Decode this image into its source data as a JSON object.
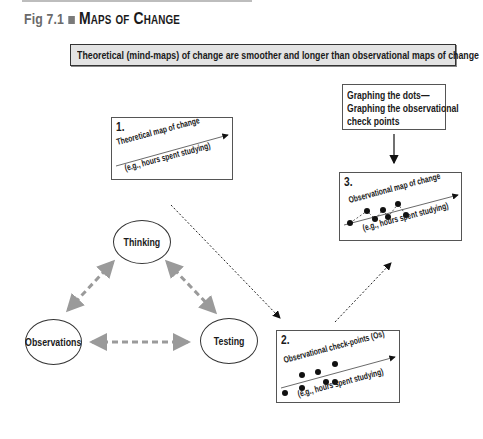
{
  "figure": {
    "number": "Fig 7.1",
    "title": "Maps of Change"
  },
  "banner": {
    "text": "Theoretical (mind-maps) of change are smoother and longer than observational maps of change"
  },
  "note": {
    "lines": [
      "Graphing the dots—",
      "Graphing the observational",
      "check points"
    ]
  },
  "panels": [
    {
      "number": "1.",
      "label": "Theoretical map of change",
      "axis_label": "(e.g., hours spent studying)"
    },
    {
      "number": "2.",
      "label": "Observational check-points (Os)",
      "axis_label": "(e.g., hours spent studying)"
    },
    {
      "number": "3.",
      "label": "Observational map of change",
      "axis_label": "(e.g., hours spent studying)"
    }
  ],
  "cycle": {
    "nodes": [
      "Thinking",
      "Observations",
      "Testing"
    ],
    "connector_color": "#9a9a9a"
  },
  "colors": {
    "banner_fill": "#e3e3e3",
    "border": "#333333",
    "dashed_arrow": "#9a9a9a"
  }
}
